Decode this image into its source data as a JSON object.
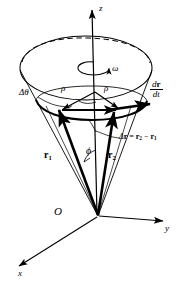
{
  "figure": {
    "name": "rotating-position-vector-cone-diagram",
    "background_color": "#ffffff",
    "ink_color": "#000000"
  },
  "axes": {
    "z_label": "z",
    "y_label": "y",
    "x_label": "x",
    "origin_label": "O"
  },
  "labels": {
    "omega": "ω",
    "delta_theta": "Δθ",
    "rho_left": "ρ",
    "rho_right": "ρ",
    "phi": "ϕ",
    "r1": "r",
    "r1_sub": "1",
    "r2": "r",
    "r2_sub": "2",
    "delta_r_prefix": "Δ",
    "delta_r_vec": "r",
    "equals": " = ",
    "term1": "r",
    "term1_sub": "2",
    "minus": " − ",
    "term2": "r",
    "term2_sub": "1",
    "derivative_num_d": "d",
    "derivative_num_r": "r",
    "derivative_den_d": "d",
    "derivative_den_t": "t"
  },
  "geometry": {
    "origin": [
      98,
      216
    ],
    "cone_apex": [
      98,
      216
    ],
    "top_ellipse_center": [
      86,
      68
    ],
    "top_ellipse_rx": 66,
    "top_ellipse_ry": 32,
    "path_ellipse_center": [
      90,
      104
    ],
    "path_ellipse_rx": 56,
    "path_ellipse_ry": 20,
    "z_axis_top": [
      92,
      6
    ],
    "y_axis_end": [
      168,
      222
    ],
    "x_axis_end": [
      14,
      272
    ]
  }
}
